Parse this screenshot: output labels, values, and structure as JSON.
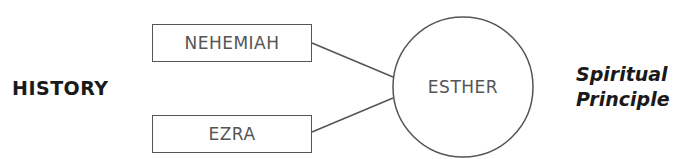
{
  "diagram": {
    "left_label": "HISTORY",
    "boxes": [
      {
        "label": "NEHEMIAH"
      },
      {
        "label": "EZRA"
      }
    ],
    "center": {
      "label": "ESTHER"
    },
    "right_label": {
      "line1": "Spiritual",
      "line2": "Principle"
    },
    "colors": {
      "stroke": "#555555",
      "text_bold": "#1a1a1a"
    }
  }
}
